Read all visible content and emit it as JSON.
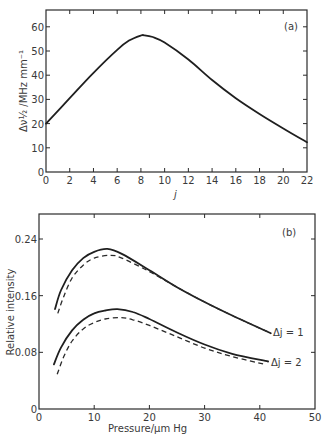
{
  "chart_data": [
    {
      "id": "a",
      "type": "line",
      "panel_label": "(a)",
      "title": "",
      "xlabel": "j",
      "ylabel": "Δν½ /MHz mm⁻¹",
      "xlim": [
        0,
        22
      ],
      "ylim": [
        0,
        66
      ],
      "xticks": [
        0,
        2,
        4,
        6,
        8,
        10,
        12,
        14,
        16,
        18,
        20,
        22
      ],
      "yticks": [
        0,
        10,
        20,
        30,
        40,
        50,
        60
      ],
      "grid": false,
      "series": [
        {
          "name": "linewidth",
          "style": "solid",
          "x": [
            0,
            2,
            4,
            6,
            7,
            8,
            8.3,
            9,
            10,
            12,
            14,
            16,
            18,
            20,
            22
          ],
          "y": [
            20,
            30.5,
            41,
            50.5,
            54.3,
            56.4,
            56.5,
            55.8,
            53.5,
            46.5,
            38,
            30.5,
            24,
            18,
            12.3
          ]
        }
      ]
    },
    {
      "id": "b",
      "type": "line",
      "panel_label": "(b)",
      "title": "",
      "xlabel": "Pressure/μm Hg",
      "ylabel": "Relative intensity",
      "xlim": [
        0,
        50
      ],
      "ylim": [
        0,
        0.27
      ],
      "xticks": [
        0,
        10,
        20,
        30,
        40,
        50
      ],
      "yticks": [
        0,
        0.08,
        0.16,
        0.24
      ],
      "grid": false,
      "legend": "inline annotations at line ends",
      "series": [
        {
          "name": "Δj = 1 (solid)",
          "style": "solid",
          "x": [
            2.9,
            4,
            6,
            8,
            10,
            12.4,
            15,
            20,
            25,
            30,
            35,
            42
          ],
          "y": [
            0.141,
            0.168,
            0.196,
            0.213,
            0.222,
            0.226,
            0.219,
            0.196,
            0.172,
            0.151,
            0.132,
            0.107
          ]
        },
        {
          "name": "Δj = 1 (dashed)",
          "style": "dashed",
          "x": [
            3.4,
            4.5,
            6,
            8,
            10,
            12.9,
            15,
            20,
            25,
            30,
            35,
            42
          ],
          "y": [
            0.135,
            0.159,
            0.185,
            0.203,
            0.213,
            0.217,
            0.213,
            0.194,
            0.172,
            0.151,
            0.132,
            0.107
          ]
        },
        {
          "name": "Δj = 2 (solid)",
          "style": "solid",
          "x": [
            2.7,
            4,
            6,
            8,
            10,
            12,
            14.2,
            17,
            20,
            25,
            30,
            35,
            41.5
          ],
          "y": [
            0.063,
            0.087,
            0.111,
            0.126,
            0.135,
            0.139,
            0.141,
            0.137,
            0.127,
            0.108,
            0.091,
            0.078,
            0.067
          ],
          "label": "Δj = 2"
        },
        {
          "name": "Δj = 2 (dashed)",
          "style": "dashed",
          "x": [
            3.3,
            4.5,
            6,
            8,
            10,
            12,
            14.7,
            17,
            20,
            25,
            30,
            35,
            41
          ],
          "y": [
            0.049,
            0.074,
            0.096,
            0.113,
            0.122,
            0.127,
            0.129,
            0.126,
            0.118,
            0.102,
            0.086,
            0.074,
            0.063
          ]
        }
      ],
      "annotations": [
        "Δj = 1",
        "Δj = 2"
      ]
    }
  ],
  "panel_a": {
    "label": "(a)",
    "xlabel": "j",
    "ylabel": "Δν½ /MHz mm⁻¹",
    "xtick_labels": [
      "0",
      "2",
      "4",
      "6",
      "8",
      "10",
      "12",
      "14",
      "16",
      "18",
      "20",
      "22"
    ],
    "ytick_labels": [
      "0",
      "10",
      "20",
      "30",
      "40",
      "50",
      "60"
    ]
  },
  "panel_b": {
    "label": "(b)",
    "xlabel": "Pressure/μm Hg",
    "ylabel": "Relative intensity",
    "xtick_labels": [
      "0",
      "10",
      "20",
      "30",
      "40",
      "50"
    ],
    "ytick_labels": [
      "0",
      "0.08",
      "0.16",
      "0.24"
    ],
    "annotation_1": "Δj = 1",
    "annotation_2": "Δj = 2"
  }
}
